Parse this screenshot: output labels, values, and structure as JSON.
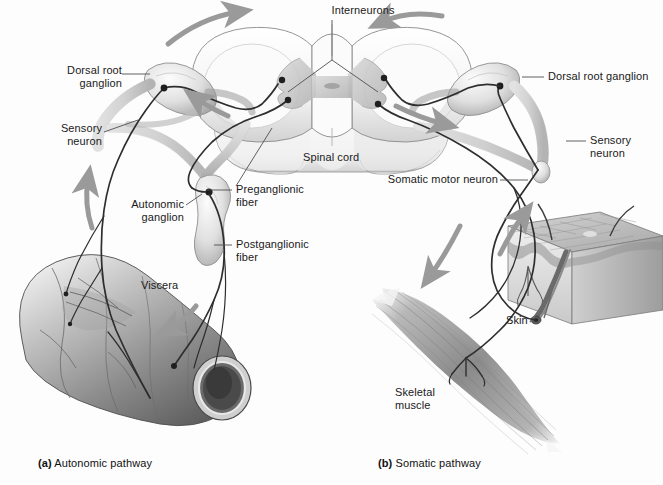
{
  "figure": {
    "background_color": "#fdfdfd",
    "label_color": "#1a1a1a",
    "leader_line_color": "#555555",
    "arrow_color": "#9a9a9a",
    "nerve_color": "#3a3a3a",
    "tissue_light": "#e8e8e8",
    "tissue_mid": "#bdbdbd",
    "tissue_dark": "#6e6e6e"
  },
  "panels": {
    "a": {
      "tag": "(a)",
      "label": "Autonomic pathway"
    },
    "b": {
      "tag": "(b)",
      "label": "Somatic pathway"
    }
  },
  "labels": {
    "interneurons": "Interneurons",
    "dorsal_root_ganglion_left": "Dorsal root\nganglion",
    "sensory_neuron_left": "Sensory\nneuron",
    "autonomic_ganglion": "Autonomic\nganglion",
    "preganglionic_fiber": "Preganglionic\nfiber",
    "postganglionic_fiber": "Postganglionic\nfiber",
    "spinal_cord": "Spinal cord",
    "viscera": "Viscera",
    "dorsal_root_ganglion_right": "Dorsal root ganglion",
    "sensory_neuron_right": "Sensory\nneuron",
    "somatic_motor_neuron": "Somatic motor neuron",
    "skin": "Skin",
    "skeletal_muscle": "Skeletal\nmuscle"
  },
  "structures": {
    "spinal_cord_segments": 3,
    "gray_matter_shape": "butterfly",
    "ganglia_count": 2,
    "synapse_dots": 6,
    "direction_arrows": 7,
    "effector_organs": [
      "viscera",
      "skeletal muscle"
    ],
    "receptor_organ": "skin"
  }
}
